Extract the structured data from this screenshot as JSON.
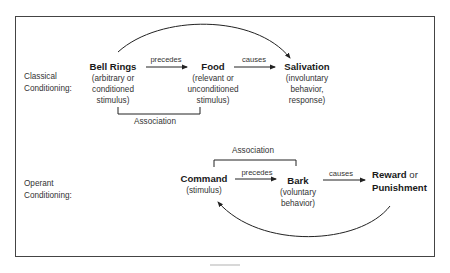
{
  "diagram": {
    "classical": {
      "row_label": [
        "Classical",
        "Conditioning:"
      ],
      "nodes": {
        "stimulus": {
          "title": "Bell Rings",
          "desc": [
            "(arbitrary or",
            "conditioned",
            "stimulus)"
          ]
        },
        "unconditioned": {
          "title": "Food",
          "desc": [
            "(relevant or",
            "unconditioned",
            "stimulus)"
          ]
        },
        "response": {
          "title": "Salivation",
          "desc": [
            "(involuntary",
            "behavior,",
            "response)"
          ]
        }
      },
      "edges": {
        "first": "precedes",
        "second": "causes"
      },
      "bracket_label": "Association"
    },
    "operant": {
      "row_label": [
        "Operant",
        "Conditioning:"
      ],
      "nodes": {
        "stimulus": {
          "title": "Command",
          "desc": [
            "(stimulus)"
          ]
        },
        "behavior": {
          "title": "Bark",
          "desc": [
            "(voluntary",
            "behavior)"
          ]
        },
        "consequence": {
          "title_bold_1": "Reward",
          "title_join": " or",
          "title_bold_2": "Punishment"
        }
      },
      "edges": {
        "first": "precedes",
        "second": "causes"
      },
      "bracket_label": "Association"
    }
  }
}
